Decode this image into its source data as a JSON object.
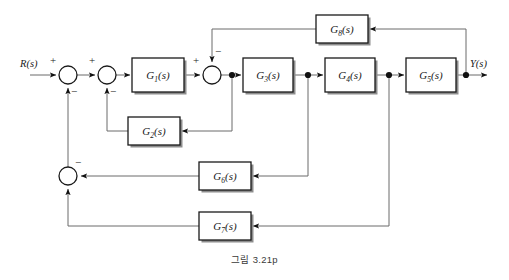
{
  "figure": {
    "caption": "그림 3.21p",
    "type": "control-system-block-diagram"
  },
  "io": {
    "input_label": "R(s)",
    "output_label": "Y(s)"
  },
  "blocks": [
    {
      "id": "G1",
      "label": "G",
      "sub": "1",
      "arg": "(s)",
      "x": 132,
      "y": 58,
      "w": 52,
      "h": 34
    },
    {
      "id": "G2",
      "label": "G",
      "sub": "2",
      "arg": "(s)",
      "x": 128,
      "y": 117,
      "w": 52,
      "h": 28
    },
    {
      "id": "G3",
      "label": "G",
      "sub": "3",
      "arg": "(s)",
      "x": 243,
      "y": 58,
      "w": 50,
      "h": 34
    },
    {
      "id": "G4",
      "label": "G",
      "sub": "4",
      "arg": "(s)",
      "x": 325,
      "y": 58,
      "w": 50,
      "h": 34
    },
    {
      "id": "G5",
      "label": "G",
      "sub": "5",
      "arg": "(s)",
      "x": 406,
      "y": 58,
      "w": 50,
      "h": 34
    },
    {
      "id": "G6",
      "label": "G",
      "sub": "6",
      "arg": "(s)",
      "x": 199,
      "y": 162,
      "w": 52,
      "h": 28
    },
    {
      "id": "G7",
      "label": "G",
      "sub": "7",
      "arg": "(s)",
      "x": 199,
      "y": 212,
      "w": 52,
      "h": 28
    },
    {
      "id": "G8",
      "label": "G",
      "sub": "8",
      "arg": "(s)",
      "x": 316,
      "y": 15,
      "w": 52,
      "h": 28
    }
  ],
  "summing_junctions": [
    {
      "id": "S1",
      "cx": 68,
      "cy": 75,
      "r": 9,
      "signs": [
        {
          "text": "+",
          "x": 53,
          "y": 64
        },
        {
          "text": "−",
          "x": 74,
          "y": 95
        }
      ]
    },
    {
      "id": "S2",
      "cx": 107,
      "cy": 75,
      "r": 9,
      "signs": [
        {
          "text": "+",
          "x": 92,
          "y": 64
        },
        {
          "text": "−",
          "x": 113,
          "y": 95
        }
      ]
    },
    {
      "id": "S3",
      "cx": 212,
      "cy": 75,
      "r": 9,
      "signs": [
        {
          "text": "+",
          "x": 196,
          "y": 64
        },
        {
          "text": "−",
          "x": 218,
          "y": 55
        }
      ]
    },
    {
      "id": "S4",
      "cx": 68,
      "cy": 176,
      "r": 9,
      "signs": [
        {
          "text": "−",
          "x": 78,
          "y": 166
        }
      ]
    }
  ],
  "nodes": [
    {
      "id": "nodeA",
      "cx": 232,
      "cy": 75
    },
    {
      "id": "nodeB",
      "cx": 308,
      "cy": 75
    },
    {
      "id": "nodeC",
      "cx": 389,
      "cy": 75
    },
    {
      "id": "nodeD",
      "cx": 466,
      "cy": 75
    }
  ],
  "signal_flow": {
    "forward_path": "R(s) → S1 → S2 → G1 → S3 → G3 → G4 → G5 → Y(s)",
    "loops": [
      "nodeA → G2 → S2 (negative)",
      "Y(s) → G8 → S3 (negative)",
      "nodeB → G6 → S4 (negative)",
      "nodeC → G7 → S4 → S1 (negative)"
    ]
  }
}
